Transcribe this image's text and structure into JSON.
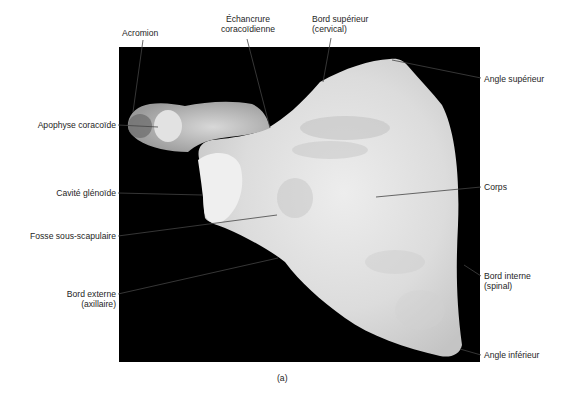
{
  "figure": {
    "caption": "(a)",
    "panel_background": "#000000",
    "bone_color": "#e6e6e6"
  },
  "labels": {
    "acromion": "Acromion",
    "echancrure_line1": "Échancrure",
    "echancrure_line2": "coracoïdienne",
    "bord_superieur_line1": "Bord supérieur",
    "bord_superieur_line2": "(cervical)",
    "angle_superieur": "Angle supérieur",
    "apophyse_coracoide": "Apophyse coracoïde",
    "cavite_glenoide": "Cavité glénoïde",
    "corps": "Corps",
    "fosse_sous_scapulaire": "Fosse sous-scapulaire",
    "bord_externe_line1": "Bord externe",
    "bord_externe_line2": "(axillaire)",
    "bord_interne_line1": "Bord interne",
    "bord_interne_line2": "(spinal)",
    "angle_inferieur": "Angle inférieur"
  }
}
